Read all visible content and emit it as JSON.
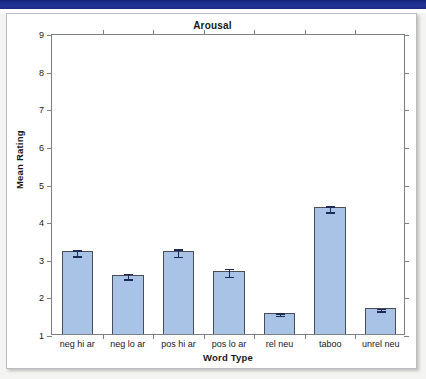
{
  "page": {
    "top_band_color": "#1f3286",
    "card_background": "#ffffff"
  },
  "chart_data": {
    "type": "bar",
    "title": "Arousal",
    "xlabel": "Word Type",
    "ylabel": "Mean Rating",
    "ylim": [
      1,
      9
    ],
    "ytick_labels": [
      "1",
      "2",
      "3",
      "4",
      "5",
      "6",
      "7",
      "8",
      "9"
    ],
    "yticks": [
      1,
      2,
      3,
      4,
      5,
      6,
      7,
      8,
      9
    ],
    "grid": false,
    "legend": "none",
    "bar_fill_color": "#a9c3e6",
    "bar_edge_color": "#4a4d55",
    "error_bar_color": "#1c2a55",
    "categories": [
      "neg hi ar",
      "neg lo ar",
      "pos hi ar",
      "pos lo ar",
      "rel neu",
      "taboo",
      "unrel neu"
    ],
    "values": [
      3.2,
      2.58,
      3.2,
      2.68,
      1.57,
      4.37,
      1.69
    ],
    "errors": [
      0.08,
      0.07,
      0.1,
      0.11,
      0.03,
      0.08,
      0.03
    ]
  }
}
